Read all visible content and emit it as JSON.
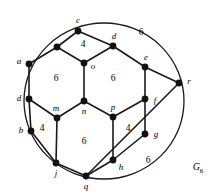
{
  "figure": {
    "name": "G",
    "name_subscript": "6",
    "name_full": "G6",
    "name_position": [
      198,
      168
    ],
    "stroke_color": "#1a1a1a",
    "vertex_color": "#111111",
    "background": "#ffffff",
    "width": 219,
    "height": 193
  },
  "outer_boundary": {
    "type": "ellipse",
    "cx": 104,
    "cy": 101,
    "rx": 80,
    "ry": 78
  },
  "vertices": [
    {
      "id": "c",
      "label": "c",
      "x": 78,
      "y": 31,
      "label_x": 78,
      "label_y": 20
    },
    {
      "id": "v1",
      "label": "",
      "x": 57,
      "y": 47,
      "label_x": 0,
      "label_y": 0
    },
    {
      "id": "d1",
      "label": "d",
      "x": 113,
      "y": 46,
      "label_x": 114,
      "label_y": 36
    },
    {
      "id": "o",
      "label": "o",
      "x": 84,
      "y": 63,
      "label_x": 93,
      "label_y": 66
    },
    {
      "id": "a",
      "label": "a",
      "x": 29,
      "y": 64,
      "label_x": 19,
      "label_y": 61
    },
    {
      "id": "e",
      "label": "e",
      "x": 145,
      "y": 67,
      "label_x": 146,
      "label_y": 57
    },
    {
      "id": "r",
      "label": "r",
      "x": 179,
      "y": 83,
      "label_x": 189,
      "label_y": 81
    },
    {
      "id": "d2",
      "label": "d",
      "x": 29,
      "y": 99,
      "label_x": 19,
      "label_y": 98
    },
    {
      "id": "n",
      "label": "n",
      "x": 84,
      "y": 101,
      "label_x": 84,
      "label_y": 111
    },
    {
      "id": "f",
      "label": "f",
      "x": 145,
      "y": 99,
      "label_x": 155,
      "label_y": 100
    },
    {
      "id": "m",
      "label": "m",
      "x": 57,
      "y": 118,
      "label_x": 56,
      "label_y": 108
    },
    {
      "id": "p",
      "label": "p",
      "x": 113,
      "y": 117,
      "label_x": 113,
      "label_y": 107
    },
    {
      "id": "b",
      "label": "b",
      "x": 31,
      "y": 131,
      "label_x": 21,
      "label_y": 130
    },
    {
      "id": "g",
      "label": "g",
      "x": 145,
      "y": 134,
      "label_x": 156,
      "label_y": 134
    },
    {
      "id": "j",
      "label": "j",
      "x": 56,
      "y": 163,
      "label_x": 56,
      "label_y": 173
    },
    {
      "id": "h",
      "label": "h",
      "x": 113,
      "y": 160,
      "label_x": 121,
      "label_y": 167
    },
    {
      "id": "q",
      "label": "q",
      "x": 86,
      "y": 176,
      "label_x": 86,
      "label_y": 186
    }
  ],
  "edges": [
    [
      "c",
      "v1"
    ],
    [
      "c",
      "d1"
    ],
    [
      "v1",
      "a"
    ],
    [
      "v1",
      "o"
    ],
    [
      "d1",
      "o"
    ],
    [
      "d1",
      "e"
    ],
    [
      "o",
      "n"
    ],
    [
      "a",
      "d2"
    ],
    [
      "e",
      "r"
    ],
    [
      "e",
      "f"
    ],
    [
      "r",
      "q"
    ],
    [
      "d2",
      "b"
    ],
    [
      "d2",
      "m"
    ],
    [
      "n",
      "m"
    ],
    [
      "n",
      "p"
    ],
    [
      "f",
      "p"
    ],
    [
      "f",
      "g"
    ],
    [
      "m",
      "j"
    ],
    [
      "p",
      "h"
    ],
    [
      "b",
      "j"
    ],
    [
      "g",
      "h"
    ],
    [
      "j",
      "q"
    ],
    [
      "h",
      "q"
    ]
  ],
  "face_labels": [
    {
      "value": "6",
      "x": 141,
      "y": 33,
      "name": "face-label-top-right-6"
    },
    {
      "value": "4",
      "x": 83,
      "y": 45,
      "name": "face-label-top-4"
    },
    {
      "value": "6",
      "x": 56,
      "y": 79,
      "name": "face-label-left-6"
    },
    {
      "value": "6",
      "x": 113,
      "y": 79,
      "name": "face-label-right-6"
    },
    {
      "value": "4",
      "x": 42,
      "y": 129,
      "name": "face-label-lower-left-4"
    },
    {
      "value": "4",
      "x": 128,
      "y": 129,
      "name": "face-label-lower-right-4"
    },
    {
      "value": "6",
      "x": 84,
      "y": 142,
      "name": "face-label-bottom-6"
    },
    {
      "value": "6",
      "x": 148,
      "y": 161,
      "name": "face-label-bottom-right-6"
    }
  ]
}
